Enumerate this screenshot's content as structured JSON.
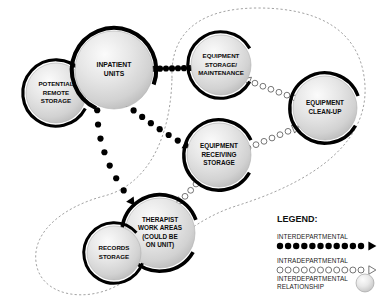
{
  "diagram": {
    "nodes": [
      {
        "id": "potential-remote-storage",
        "label_lines": [
          "POTENTIAL",
          "REMOTE",
          "STORAGE"
        ],
        "cx": 56,
        "cy": 93,
        "r": 30,
        "font_size": 6.2,
        "ring_start": 118,
        "ring_end": 410
      },
      {
        "id": "inpatient-units",
        "label_lines": [
          "INPATIENT",
          "UNITS"
        ],
        "cx": 114,
        "cy": 70,
        "r": 39,
        "font_size": 6.8,
        "ring_start": 205,
        "ring_end": 470
      },
      {
        "id": "equipment-storage-maintenance",
        "label_lines": [
          "EQUIPMENT",
          "STORAGE/",
          "MAINTENANCE"
        ],
        "cx": 221,
        "cy": 65,
        "r": 30,
        "font_size": 6.2,
        "ring_start": 120,
        "ring_end": 420
      },
      {
        "id": "equipment-clean-up",
        "label_lines": [
          "EQUIPMENT",
          "CLEAN-UP"
        ],
        "cx": 325,
        "cy": 108,
        "r": 32,
        "font_size": 6.4,
        "ring_start": 120,
        "ring_end": 430
      },
      {
        "id": "equipment-receiving-storage",
        "label_lines": [
          "EQUIPMENT",
          "RECEIVING",
          "STORAGE"
        ],
        "cx": 219,
        "cy": 155,
        "r": 32,
        "font_size": 6.4,
        "ring_start": 120,
        "ring_end": 425
      },
      {
        "id": "therapist-work-areas",
        "label_lines": [
          "THERAPIST",
          "WORK AREAS",
          "(COULD BE",
          "ON UNIT)"
        ],
        "cx": 160,
        "cy": 233,
        "r": 35,
        "font_size": 6.4,
        "ring_start": 120,
        "ring_end": 430
      },
      {
        "id": "records-storage",
        "label_lines": [
          "RECORDS",
          "STORAGE"
        ],
        "cx": 114,
        "cy": 253,
        "r": 27,
        "font_size": 6.2,
        "ring_start": 110,
        "ring_end": 408
      }
    ],
    "interdepartmental_links": [
      {
        "id": "inpatient-to-equipment-storage",
        "from": "inpatient-units",
        "to": "equipment-storage-maintenance",
        "path": "M 142 69 L 190 68",
        "arrow_at": "start"
      },
      {
        "id": "inpatient-to-equipment-receiving",
        "from": "inpatient-units",
        "to": "equipment-receiving-storage",
        "path": "M 117 97 Q 150 125 187 146",
        "arrow_at": "end"
      },
      {
        "id": "inpatient-to-therapist",
        "from": "inpatient-units",
        "to": "therapist-work-areas",
        "path": "M 98 96 Q 92 150 132 202",
        "arrow_at": "end"
      }
    ],
    "intradepartmental_links": [
      {
        "id": "equipment-storage-to-clean-up",
        "from": "equipment-storage-maintenance",
        "to": "equipment-clean-up",
        "path": "M 247 80 Q 272 90 295 98",
        "arrow_at": "start"
      },
      {
        "id": "equipment-receiving-to-clean-up",
        "from": "equipment-receiving-storage",
        "to": "equipment-clean-up",
        "path": "M 248 148 Q 272 138 296 128",
        "arrow_at": "end"
      },
      {
        "id": "therapist-to-equipment-receiving",
        "from": "therapist-work-areas",
        "to": "equipment-receiving-storage",
        "path": "M 179 202 Q 188 194 196 184",
        "arrow_at": "start"
      }
    ],
    "boundaries": [
      {
        "id": "interdepartmental-boundary",
        "path": "M 172 78 C 170 28 206 8 258 8 C 318 8 362 30 365 86 C 368 150 300 186 236 206 C 186 222 156 260 120 284 C 86 304 40 296 36 262 C 32 230 66 206 104 196 C 140 187 170 150 172 78 Z"
      }
    ]
  },
  "legend": {
    "title": "LEGEND:",
    "items": [
      {
        "id": "interdepartmental",
        "label": "INTERDEPARTMENTAL",
        "style": "solid-dots-arrow"
      },
      {
        "id": "intradepartmental",
        "label": "INTRADEPARTMENTAL",
        "style": "hollow-dots-arrow"
      },
      {
        "id": "interdepartmental-relationship",
        "label_lines": [
          "INTERDEPARTMENTAL",
          "RELATIONSHIP"
        ],
        "style": "sphere"
      }
    ]
  },
  "colors": {
    "node_fill_light": "#f4f4f4",
    "node_fill_mid": "#d8d8d8",
    "node_fill_edge": "#bdbdbd",
    "ring_stroke": "#000000",
    "boundary_stroke": "#8a8a8a",
    "text": "#0b0b0b"
  }
}
